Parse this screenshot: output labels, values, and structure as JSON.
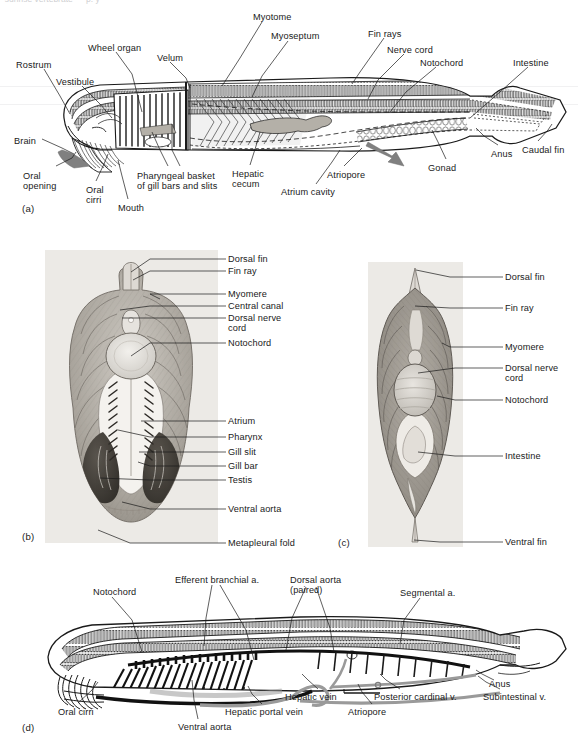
{
  "figure": {
    "top_remnant_text": "  sunrise vertebrate — p. y",
    "panel_letters": {
      "a": "(a)",
      "b": "(b)",
      "c": "(c)",
      "d": "(d)"
    }
  },
  "colors": {
    "ink": "#1a1a1a",
    "leader": "#1a1a1a",
    "paper": "#ffffff",
    "photo_bg": "#eceae6",
    "muscle_light": "#c8c4bd",
    "muscle_dark": "#8f8b84",
    "gonad_dark": "#4a4640",
    "arrow_grey": "#808080",
    "organ_grey": "#b4b0a8",
    "vessel_grey": "#9a9a9a"
  },
  "panel_a": {
    "letter": "(a)",
    "caption": "Sagittal view of whole amphioxus",
    "labels": [
      {
        "id": "myotome",
        "text": "Myotome",
        "x": 253,
        "y": 12,
        "align": "left"
      },
      {
        "id": "myoseptum",
        "text": "Myoseptum",
        "x": 271,
        "y": 31,
        "align": "left"
      },
      {
        "id": "fin-rays",
        "text": "Fin rays",
        "x": 368,
        "y": 29,
        "align": "left"
      },
      {
        "id": "nerve-cord",
        "text": "Nerve cord",
        "x": 387,
        "y": 45,
        "align": "left"
      },
      {
        "id": "notochord",
        "text": "Notochord",
        "x": 420,
        "y": 58,
        "align": "left"
      },
      {
        "id": "intestine",
        "text": "Intestine",
        "x": 513,
        "y": 58,
        "align": "left"
      },
      {
        "id": "wheel-organ",
        "text": "Wheel organ",
        "x": 88,
        "y": 43,
        "align": "left"
      },
      {
        "id": "velum",
        "text": "Velum",
        "x": 157,
        "y": 53,
        "align": "left"
      },
      {
        "id": "rostrum",
        "text": "Rostrum",
        "x": 16,
        "y": 60,
        "align": "left"
      },
      {
        "id": "vestibule",
        "text": "Vestibule",
        "x": 56,
        "y": 77,
        "align": "left"
      },
      {
        "id": "brain",
        "text": "Brain",
        "x": 14,
        "y": 136,
        "align": "left"
      },
      {
        "id": "oral-opening",
        "text": "Oral\nopening",
        "x": 23,
        "y": 171,
        "align": "left"
      },
      {
        "id": "oral-cirri",
        "text": "Oral\ncirri",
        "x": 86,
        "y": 185,
        "align": "left"
      },
      {
        "id": "mouth",
        "text": "Mouth",
        "x": 118,
        "y": 203,
        "align": "left"
      },
      {
        "id": "pharyngeal",
        "text": "Pharyngeal basket\nof gill bars and slits",
        "x": 137,
        "y": 171,
        "align": "left"
      },
      {
        "id": "hepatic",
        "text": "Hepatic\ncecum",
        "x": 232,
        "y": 169,
        "align": "left"
      },
      {
        "id": "atrium",
        "text": "Atrium cavity",
        "x": 281,
        "y": 187,
        "align": "left"
      },
      {
        "id": "atriopore",
        "text": "Atriopore",
        "x": 327,
        "y": 170,
        "align": "left"
      },
      {
        "id": "gonad",
        "text": "Gonad",
        "x": 428,
        "y": 163,
        "align": "left"
      },
      {
        "id": "anus",
        "text": "Anus",
        "x": 491,
        "y": 149,
        "align": "left"
      },
      {
        "id": "caudal-fin",
        "text": "Caudal fin",
        "x": 522,
        "y": 145,
        "align": "left"
      }
    ]
  },
  "panel_b": {
    "letter": "(b)",
    "caption": "Cross section through the pharyngeal region",
    "label_x": 228,
    "labels": [
      {
        "id": "dorsal-fin",
        "text": "Dorsal fin",
        "y": 256
      },
      {
        "id": "fin-ray",
        "text": "Fin ray",
        "y": 268
      },
      {
        "id": "myomere",
        "text": "Myomere",
        "y": 291
      },
      {
        "id": "central-canal",
        "text": "Central canal",
        "y": 303
      },
      {
        "id": "dorsal-nerve",
        "text": "Dorsal nerve\ncord",
        "y": 315
      },
      {
        "id": "notochord",
        "text": "Notochord",
        "y": 340
      },
      {
        "id": "atrium",
        "text": "Atrium",
        "y": 418
      },
      {
        "id": "pharynx",
        "text": "Pharynx",
        "y": 434
      },
      {
        "id": "gill-slit",
        "text": "Gill slit",
        "y": 449
      },
      {
        "id": "gill-bar",
        "text": "Gill bar",
        "y": 463
      },
      {
        "id": "testis",
        "text": "Testis",
        "y": 477
      },
      {
        "id": "ventral-aorta",
        "text": "Ventral aorta",
        "y": 506
      },
      {
        "id": "metapleural",
        "text": "Metapleural fold",
        "y": 540
      }
    ]
  },
  "panel_c": {
    "letter": "(c)",
    "caption": "Cross section through the intestinal region",
    "label_x": 505,
    "labels": [
      {
        "id": "dorsal-fin",
        "text": "Dorsal fin",
        "y": 274
      },
      {
        "id": "fin-ray",
        "text": "Fin ray",
        "y": 305
      },
      {
        "id": "myomere",
        "text": "Myomere",
        "y": 344
      },
      {
        "id": "dorsal-nerve",
        "text": "Dorsal nerve\ncord",
        "y": 365
      },
      {
        "id": "notochord",
        "text": "Notochord",
        "y": 397
      },
      {
        "id": "intestine",
        "text": "Intestine",
        "y": 453
      },
      {
        "id": "ventral-fin",
        "text": "Ventral fin",
        "y": 539
      }
    ]
  },
  "panel_d": {
    "letter": "(d)",
    "caption": "Circulatory system of amphioxus",
    "labels": [
      {
        "id": "notochord",
        "text": "Notochord",
        "x": 93,
        "y": 587,
        "align": "left"
      },
      {
        "id": "efferent-branchial",
        "text": "Efferent branchial a.",
        "x": 175,
        "y": 575,
        "align": "left"
      },
      {
        "id": "dorsal-aorta",
        "text": "Dorsal aorta\n(paired)",
        "x": 290,
        "y": 575,
        "align": "left"
      },
      {
        "id": "segmental-a",
        "text": "Segmental a.",
        "x": 400,
        "y": 588,
        "align": "left"
      },
      {
        "id": "oral-cirri",
        "text": "Oral cirri",
        "x": 58,
        "y": 707,
        "align": "left"
      },
      {
        "id": "ventral-aorta",
        "text": "Ventral aorta",
        "x": 178,
        "y": 722,
        "align": "left"
      },
      {
        "id": "hepatic-portal",
        "text": "Hepatic portal vein",
        "x": 225,
        "y": 707,
        "align": "left"
      },
      {
        "id": "hepatic-vein",
        "text": "Hepatic vein",
        "x": 285,
        "y": 692,
        "align": "left"
      },
      {
        "id": "atriopore",
        "text": "Atriopore",
        "x": 348,
        "y": 707,
        "align": "left"
      },
      {
        "id": "posterior-cardinal",
        "text": "Posterior cardinal v.",
        "x": 374,
        "y": 692,
        "align": "left"
      },
      {
        "id": "subintestinal",
        "text": "Subintestinal v.",
        "x": 483,
        "y": 692,
        "align": "left"
      },
      {
        "id": "anus",
        "text": "Anus",
        "x": 489,
        "y": 679,
        "align": "left"
      }
    ]
  }
}
